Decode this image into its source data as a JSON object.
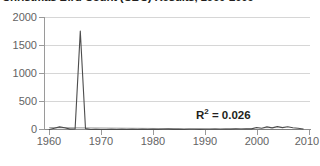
{
  "chart_data": {
    "type": "line",
    "title": "Christmas Bird Count (CBC) Results, 1960-2009",
    "xlabel": "",
    "ylabel": "",
    "xlim": [
      1959,
      2010.5
    ],
    "ylim": [
      0,
      2000
    ],
    "grid": true,
    "legend": "none",
    "y_ticks": [
      0,
      500,
      1000,
      1500,
      2000
    ],
    "y_tick_labels": [
      "0",
      "500",
      "1000",
      "1500",
      "2000"
    ],
    "x_ticks": [
      1960,
      1970,
      1980,
      1990,
      2000,
      2010
    ],
    "x_tick_labels": [
      "1960",
      "1970",
      "1980",
      "1990",
      "2000",
      "2010"
    ],
    "annotations": [
      {
        "name": "r-squared",
        "text_prefix": "R",
        "text_sup": "2",
        "text_suffix": " = 0.026",
        "value": 0.026
      }
    ],
    "series": [
      {
        "name": "CBC count",
        "color": "#4d4d4d",
        "x": [
          1960,
          1961,
          1962,
          1963,
          1964,
          1965,
          1966,
          1967,
          1968,
          1969,
          1970,
          1971,
          1972,
          1973,
          1974,
          1975,
          1976,
          1977,
          1978,
          1979,
          1980,
          1981,
          1982,
          1983,
          1984,
          1985,
          1986,
          1987,
          1988,
          1989,
          1990,
          1991,
          1992,
          1993,
          1994,
          1995,
          1996,
          1997,
          1998,
          1999,
          2000,
          2001,
          2002,
          2003,
          2004,
          2005,
          2006,
          2007,
          2008,
          2009
        ],
        "values": [
          10,
          30,
          55,
          40,
          15,
          20,
          1750,
          25,
          10,
          12,
          8,
          10,
          12,
          9,
          14,
          10,
          12,
          9,
          11,
          10,
          13,
          10,
          12,
          15,
          11,
          13,
          10,
          12,
          14,
          11,
          13,
          12,
          15,
          14,
          18,
          16,
          20,
          18,
          22,
          20,
          45,
          30,
          55,
          38,
          60,
          42,
          58,
          40,
          30,
          18
        ]
      },
      {
        "name": "linear trend",
        "color": "#7a7a7a",
        "x": [
          1960,
          2009
        ],
        "values": [
          42,
          6
        ]
      }
    ]
  }
}
